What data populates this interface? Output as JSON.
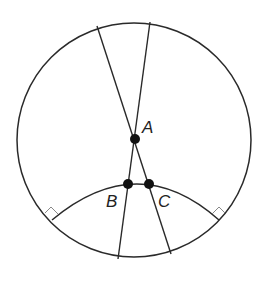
{
  "diagram": {
    "type": "geometry",
    "stroke_color": "#2a2a2a",
    "point_color": "#111111",
    "points": {
      "A": {
        "label": "A",
        "x": 135,
        "y": 139
      },
      "B": {
        "label": "B",
        "x": 128,
        "y": 184
      },
      "C": {
        "label": "C",
        "x": 149,
        "y": 184
      }
    },
    "circle": {
      "cx": 134,
      "cy": 140,
      "r": 117
    },
    "right_angle_markers": 2
  }
}
